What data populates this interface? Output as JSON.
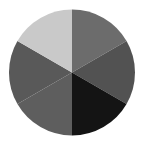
{
  "chart_data": {
    "type": "pie",
    "title": "",
    "categories": [
      "Slice 1",
      "Slice 2",
      "Slice 3",
      "Slice 4",
      "Slice 5",
      "Slice 6"
    ],
    "values": [
      1,
      1,
      1,
      1,
      1,
      1
    ],
    "colors": [
      "#6c6c6c",
      "#525252",
      "#141414",
      "#5e5e5e",
      "#595959",
      "#c9c9c9"
    ],
    "start_angle_deg": 0,
    "direction": "clockwise",
    "legend": "none",
    "labels_shown": false
  },
  "layout": {
    "cx": 72,
    "cy": 72.5,
    "r": 63
  }
}
